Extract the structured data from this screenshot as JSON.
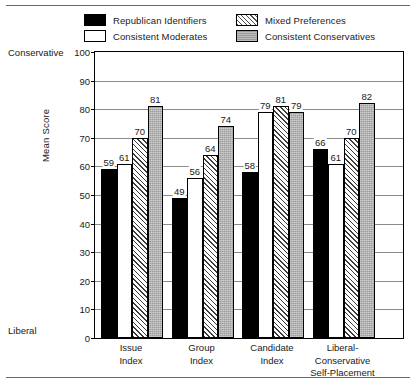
{
  "chart_data": {
    "type": "bar",
    "title": "",
    "xlabel": "",
    "ylabel": "Mean Score",
    "ylim": [
      0,
      100
    ],
    "yticks": [
      0,
      10,
      20,
      30,
      40,
      50,
      60,
      70,
      80,
      90,
      100
    ],
    "grid": true,
    "legend_position": "top",
    "axis_endpoint_labels": {
      "top": "Conservative",
      "bottom": "Liberal"
    },
    "categories": [
      "Issue\nIndex",
      "Group\nIndex",
      "Candidate\nIndex",
      "Liberal-\nConservative\nSelf-Placement"
    ],
    "series": [
      {
        "name": "Republican Identifiers",
        "pattern": "solid-black",
        "values": [
          59,
          49,
          58,
          66
        ]
      },
      {
        "name": "Consistent Moderates",
        "pattern": "solid-white",
        "values": [
          61,
          56,
          79,
          61
        ]
      },
      {
        "name": "Mixed Preferences",
        "pattern": "diagonal-hatch",
        "values": [
          70,
          64,
          81,
          70
        ]
      },
      {
        "name": "Consistent Conservatives",
        "pattern": "solid-gray",
        "values": [
          81,
          74,
          79,
          82
        ]
      }
    ]
  },
  "legend": {
    "items": [
      {
        "label": "Republican Identifiers",
        "swatch": "swatch-black"
      },
      {
        "label": "Mixed Preferences",
        "swatch": "swatch-hatch"
      },
      {
        "label": "Consistent Moderates",
        "swatch": "swatch-white"
      },
      {
        "label": "Consistent Conservatives",
        "swatch": "swatch-gray"
      }
    ]
  },
  "colors": {
    "frame": "#000000",
    "gridline": "#8c8c8c",
    "rule": "#6a6a6a",
    "black_fill": "#000000",
    "white_fill": "#ffffff",
    "gray_fill": "#9c9c9c",
    "hatch_line": "#3d3d3d"
  }
}
